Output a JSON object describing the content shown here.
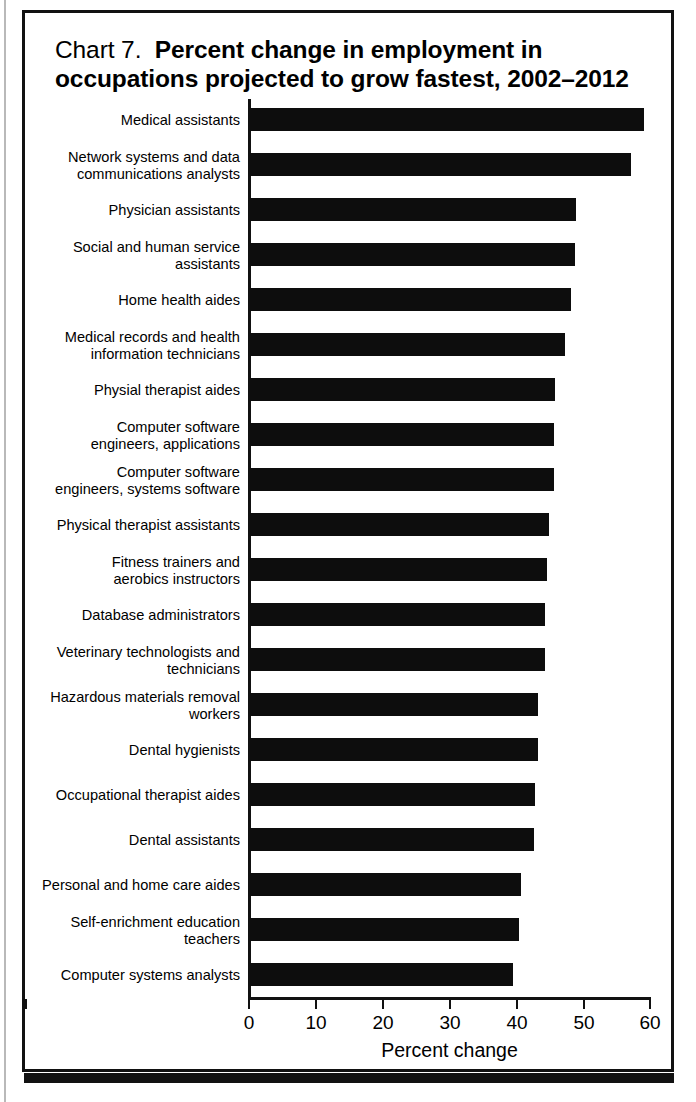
{
  "title": {
    "lead": "Chart 7.",
    "strong_line1": "Percent change in employment in",
    "strong_line2": "occupations projected to grow fastest, 2002–2012"
  },
  "axis": {
    "x_title": "Percent change",
    "x_ticks": [
      "0",
      "10",
      "20",
      "30",
      "40",
      "50",
      "60"
    ]
  },
  "colors": {
    "bar": "#0d0d0d",
    "axis": "#111111",
    "frame": "#111111",
    "background": "#ffffff",
    "text": "#000000"
  },
  "chart_data": {
    "type": "bar",
    "orientation": "horizontal",
    "xlabel": "Percent change",
    "ylabel": "",
    "xlim": [
      0,
      60
    ],
    "xticks": [
      0,
      10,
      20,
      30,
      40,
      50,
      60
    ],
    "grid": false,
    "legend": null,
    "categories": [
      "Medical assistants",
      "Network systems and data\ncommunications analysts",
      "Physician assistants",
      "Social and human service\nassistants",
      "Home health aides",
      "Medical records and health\ninformation technicians",
      "Physial therapist aides",
      "Computer software\nengineers, applications",
      "Computer software\nengineers, systems software",
      "Physical therapist assistants",
      "Fitness trainers and\naerobics instructors",
      "Database administrators",
      "Veterinary technologists and\ntechnicians",
      "Hazardous materials removal\nworkers",
      "Dental hygienists",
      "Occupational therapist aides",
      "Dental assistants",
      "Personal and home care aides",
      "Self-enrichment education\nteachers",
      "Computer systems analysts"
    ],
    "values": [
      58.9,
      57.0,
      48.8,
      48.7,
      48.1,
      47.1,
      45.7,
      45.5,
      45.5,
      44.8,
      44.5,
      44.2,
      44.1,
      43.1,
      43.1,
      42.6,
      42.5,
      40.5,
      40.3,
      39.4
    ]
  }
}
